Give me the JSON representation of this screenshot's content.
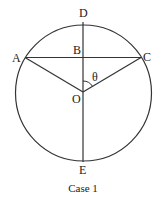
{
  "diagram": {
    "caption": "Case 1",
    "labels": {
      "D": "D",
      "A": "A",
      "B": "B",
      "C": "C",
      "O": "O",
      "E": "E",
      "theta": "θ"
    },
    "colors": {
      "stroke": "#333333",
      "text": "#222222",
      "background": "#ffffff"
    }
  }
}
